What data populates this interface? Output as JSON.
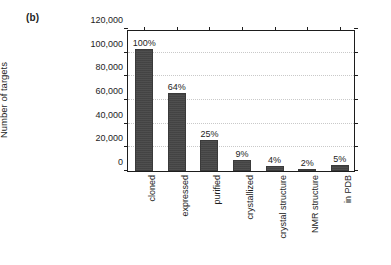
{
  "figure": {
    "panel_label": "(b)"
  },
  "chart_data": {
    "type": "bar",
    "title": "",
    "xlabel": "",
    "ylabel": "Number of targets",
    "ylim": [
      0,
      120000
    ],
    "ytick_labels": [
      "0",
      "20,000",
      "40,000",
      "60,000",
      "80,000",
      "100,000",
      "120,000"
    ],
    "ytick_values": [
      0,
      20000,
      40000,
      60000,
      80000,
      100000,
      120000
    ],
    "grid": true,
    "grid_axis": "y",
    "legend": false,
    "bar_color": "#474747",
    "categories": [
      "cloned",
      "expressed",
      "purified",
      "crystallized",
      "crystal structure",
      "NMR structure",
      "in PDB"
    ],
    "values": [
      103000,
      66000,
      26000,
      9500,
      4000,
      2000,
      5000
    ],
    "data_labels": [
      "100%",
      "64%",
      "25%",
      "9%",
      "4%",
      "2%",
      "5%"
    ],
    "percentages": [
      100,
      64,
      25,
      9,
      4,
      2,
      5
    ]
  }
}
